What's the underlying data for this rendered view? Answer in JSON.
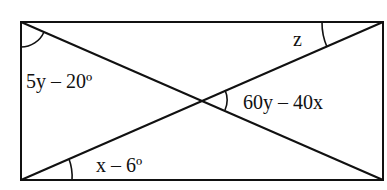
{
  "diagram": {
    "type": "rectangle-with-diagonals",
    "colors": {
      "stroke": "#111111",
      "background": "#ffffff",
      "text": "#111111"
    },
    "rectangle": {
      "x1": 21,
      "y1": 22,
      "x2": 383,
      "y2": 180
    },
    "intersection": {
      "x": 202,
      "y": 100
    },
    "labels": {
      "top_left_angle": "5y – 20º",
      "top_right_angle": "z",
      "center_right_angle": "60y – 40x",
      "bottom_left_angle": "x – 6º"
    }
  }
}
